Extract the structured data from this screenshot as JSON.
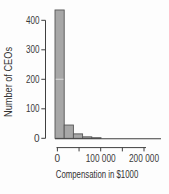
{
  "chart_data": {
    "type": "bar",
    "subtype": "histogram",
    "title": "",
    "ylabel": "Number of CEOs",
    "xlabel": "Compensation in $1000",
    "bin_edges": [
      0,
      20000,
      40000,
      60000,
      80000,
      100000
    ],
    "counts": [
      435,
      45,
      15,
      5,
      2
    ],
    "ylim": [
      0,
      440
    ],
    "xlim": [
      0,
      240000
    ],
    "yticks": [
      {
        "value": 0,
        "label": "0"
      },
      {
        "value": 100,
        "label": "100"
      },
      {
        "value": 200,
        "label": "200"
      },
      {
        "value": 300,
        "label": "300"
      },
      {
        "value": 400,
        "label": "400"
      }
    ],
    "xticks": [
      {
        "value": 0,
        "label": "0"
      },
      {
        "value": 50000,
        "label": ""
      },
      {
        "value": 100000,
        "label": "100 000"
      },
      {
        "value": 150000,
        "label": ""
      },
      {
        "value": 200000,
        "label": "200 000"
      }
    ],
    "grid": "off",
    "legend": "none",
    "colors": {
      "bar_fill": "#a7a7a7",
      "bar_stroke": "#565656",
      "axis": "#3f3f3f",
      "text": "#3a3a3a",
      "background": "#fdfdfd"
    }
  }
}
